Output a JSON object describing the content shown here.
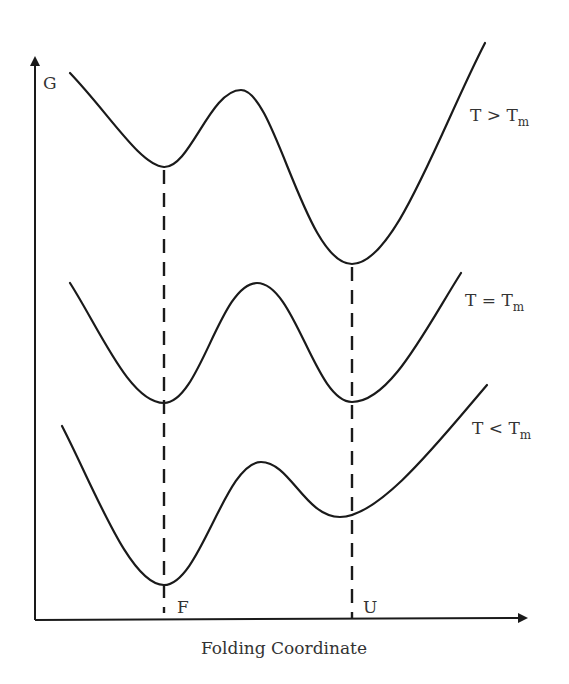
{
  "diagram": {
    "y_axis_label": "G",
    "x_axis_label": "Folding Coordinate",
    "states": [
      {
        "label": "F",
        "x": 164
      },
      {
        "label": "U",
        "x": 352
      }
    ],
    "curves": [
      {
        "name": "T > Tm",
        "label_main": "T > T",
        "label_sub": "m",
        "path": "M70,73 C110,115 140,165 164,167 C190,168 210,90 241,90 C275,90 305,264 352,264 C395,264 440,130 485,43"
      },
      {
        "name": "T = Tm",
        "label_main": "T = T",
        "label_sub": "m",
        "path": "M70,283 C100,330 130,403 164,403 C200,403 220,283 257,283 C295,283 315,402 352,402 C390,402 425,330 461,273"
      },
      {
        "name": "T < Tm",
        "label_main": "T < T",
        "label_sub": "m",
        "path": "M62,426 C95,490 130,585 164,585 C200,585 225,462 261,462 C290,462 305,517 340,517 C380,517 440,440 487,385"
      }
    ],
    "colors": {
      "line": "#1a1a1a",
      "text": "#333333",
      "background": "#ffffff"
    }
  }
}
